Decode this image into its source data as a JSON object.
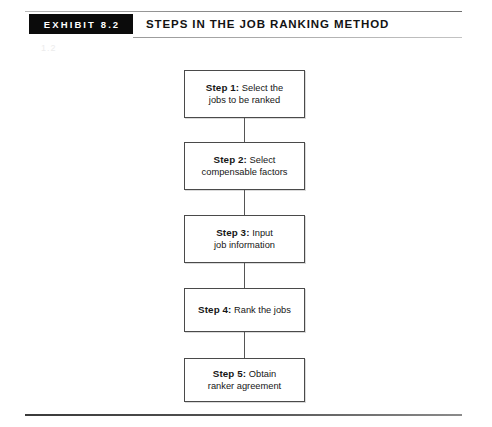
{
  "header": {
    "exhibit_tag": "EXHIBIT 8.2",
    "title": "STEPS IN THE JOB RANKING METHOD",
    "artifact_mark": "1.2"
  },
  "flowchart": {
    "type": "vertical-flowchart",
    "steps": [
      {
        "label": "Step 1:",
        "text": "Select the jobs to be ranked",
        "line1_rest": " Select the",
        "line2": "jobs to be ranked"
      },
      {
        "label": "Step 2:",
        "text": "Select compensable factors",
        "line1_rest": " Select",
        "line2": "compensable factors"
      },
      {
        "label": "Step 3:",
        "text": "Input job information",
        "line1_rest": " Input",
        "line2": "job information"
      },
      {
        "label": "Step 4:",
        "text": "Rank the jobs",
        "line1_rest": " Rank the jobs",
        "line2": ""
      },
      {
        "label": "Step 5:",
        "text": "Obtain ranker agreement",
        "line1_rest": " Obtain",
        "line2": "ranker agreement"
      }
    ]
  },
  "colors": {
    "tag_background": "#0b0b0b",
    "tag_text": "#ffffff",
    "box_border": "#4a4a4a",
    "text": "#161616",
    "rule": "#575757",
    "page_background": "#ffffff"
  }
}
